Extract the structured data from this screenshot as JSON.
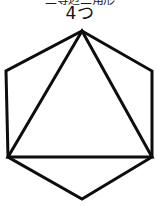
{
  "canvas": {
    "width": 206,
    "height": 206,
    "background_color": "#ffffff",
    "stroke_color": "#0d0d0d",
    "stroke_width": 3
  },
  "caption": {
    "line1_text": "二等辺三角形",
    "line1_note": "clipped-at-top-edge",
    "line2_text": "4つ"
  },
  "figure": {
    "name": "hexagon-with-inscribed-triangle",
    "shapes": [
      {
        "name": "hexagon",
        "type": "polygon",
        "sides": 6,
        "points": "82,31 152,71 152,157 82,199 8,157 6,71"
      },
      {
        "name": "inscribed-triangle",
        "type": "polygon",
        "sides": 3,
        "points": "82,31 152,157 8,157"
      }
    ]
  }
}
